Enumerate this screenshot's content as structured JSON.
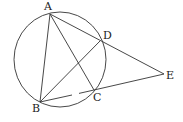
{
  "diagram": {
    "type": "geometry",
    "circle": {
      "cx": 60,
      "cy": 59.5,
      "rx": 46,
      "ry": 47.5
    },
    "points": [
      {
        "id": "A",
        "label": "A",
        "x": 50,
        "y": 14,
        "lx": 44,
        "ly": 10
      },
      {
        "id": "D",
        "label": "D",
        "x": 100,
        "y": 41,
        "lx": 103,
        "ly": 39
      },
      {
        "id": "E",
        "label": "E",
        "x": 164,
        "y": 74,
        "lx": 166,
        "ly": 79
      },
      {
        "id": "C",
        "label": "C",
        "x": 94,
        "y": 90,
        "lx": 93,
        "ly": 101
      },
      {
        "id": "B",
        "label": "B",
        "x": 40,
        "y": 102,
        "lx": 32,
        "ly": 112
      }
    ],
    "segments": [
      {
        "from": "A",
        "to": "B"
      },
      {
        "from": "A",
        "to": "C"
      },
      {
        "from": "A",
        "to": "E"
      },
      {
        "from": "B",
        "to": "D"
      },
      {
        "from": "C",
        "to": "E"
      },
      {
        "from": "B",
        "to": "C",
        "gap": [
          [
            72,
            94.8
          ],
          [
            79,
            93.4
          ]
        ]
      }
    ],
    "colors": {
      "stroke": "#333333",
      "label": "#222222",
      "background": "#ffffff"
    }
  }
}
